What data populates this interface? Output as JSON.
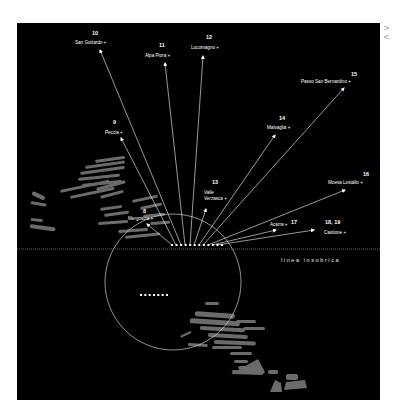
{
  "nav": {
    "arrows_label": "> <"
  },
  "diagram": {
    "panel_color": "#000000",
    "line_color": "#ffffff",
    "terrain_color": "#6b6b6b",
    "insubric_line": {
      "label": "linea insubrica",
      "y": 249
    },
    "circle": {
      "cx": 173,
      "cy": 282,
      "r": 68
    },
    "origin_row": {
      "y": 245,
      "x_start": 172,
      "x_end": 222,
      "count": 12
    },
    "lower_row": {
      "y": 295,
      "x_start": 141,
      "x_end": 167,
      "count": 7
    },
    "sites": [
      {
        "number": "8",
        "name": "Mergoscia +",
        "num_x": 143,
        "num_y": 213,
        "name_x": 128,
        "name_y": 220,
        "arrow_x": 147,
        "arrow_y": 224,
        "from_x": 172
      },
      {
        "number": "9",
        "name": "Peccia +",
        "num_x": 113,
        "num_y": 124,
        "name_x": 105,
        "name_y": 134,
        "arrow_x": 121,
        "arrow_y": 138,
        "from_x": 176
      },
      {
        "number": "10",
        "name": "San Gottardo +",
        "num_x": 92,
        "num_y": 35,
        "name_x": 75,
        "name_y": 44,
        "arrow_x": 100,
        "arrow_y": 50,
        "from_x": 181
      },
      {
        "number": "11",
        "name": "Alpa Piora +",
        "num_x": 159,
        "num_y": 47,
        "name_x": 145,
        "name_y": 57,
        "arrow_x": 165,
        "arrow_y": 63,
        "from_x": 185
      },
      {
        "number": "12",
        "name": "Lucomagno +",
        "num_x": 206,
        "num_y": 39,
        "name_x": 191,
        "name_y": 49,
        "arrow_x": 203,
        "arrow_y": 56,
        "from_x": 190
      },
      {
        "number": "13",
        "name": "Valle\nVerzasca +",
        "num_x": 212,
        "num_y": 184,
        "name_x": 204,
        "name_y": 194,
        "arrow_x": 206,
        "arrow_y": 209,
        "from_x": 194
      },
      {
        "number": "14",
        "name": "Malvaglia +",
        "num_x": 279,
        "num_y": 120,
        "name_x": 267,
        "name_y": 129,
        "arrow_x": 275,
        "arrow_y": 135,
        "from_x": 199
      },
      {
        "number": "15",
        "name": "Passo San Bernardino +",
        "num_x": 351,
        "num_y": 76,
        "name_x": 301,
        "name_y": 83,
        "arrow_x": 344,
        "arrow_y": 88,
        "from_x": 203
      },
      {
        "number": "16",
        "name": "Moesa Lostallo +",
        "num_x": 363,
        "num_y": 176,
        "name_x": 328,
        "name_y": 184,
        "arrow_x": 345,
        "arrow_y": 190,
        "from_x": 208
      },
      {
        "number": "17",
        "name": "Acarra +",
        "num_x": 291,
        "num_y": 224,
        "name_x": 270,
        "name_y": 226,
        "arrow_x": 276,
        "arrow_y": 230,
        "from_x": 212
      },
      {
        "number": "18, 19",
        "name": "Castione +",
        "num_x": 325,
        "num_y": 224,
        "name_x": 324,
        "name_y": 234,
        "arrow_x": 314,
        "arrow_y": 230,
        "from_x": 217
      }
    ]
  }
}
